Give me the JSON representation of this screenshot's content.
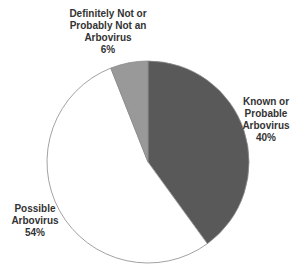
{
  "chart_data": {
    "type": "pie",
    "title": "",
    "start_angle_deg": 0,
    "direction": "clockwise",
    "slices": [
      {
        "name": "Known or Probable Arbovirus",
        "label_lines": [
          "Known or",
          "Probable",
          "Arbovirus",
          "40%"
        ],
        "value": 40,
        "color": "#595959"
      },
      {
        "name": "Possible Arbovirus",
        "label_lines": [
          "Possible",
          "Arbovirus",
          "54%"
        ],
        "value": 54,
        "color": "#ffffff"
      },
      {
        "name": "Definitely Not or Probably Not an Arbovirus",
        "label_lines": [
          "Definitely Not or",
          "Probably Not an",
          "Arbovirus",
          "6%"
        ],
        "value": 6,
        "color": "#999999"
      }
    ],
    "categories": [
      "Known or Probable Arbovirus",
      "Possible Arbovirus",
      "Definitely Not or Probably Not an Arbovirus"
    ],
    "values": [
      40,
      54,
      6
    ],
    "units": "%",
    "legend": "none (data labels beside slices)",
    "outline_color": "#8a8a8a"
  },
  "layout": {
    "cx": 148,
    "cy": 162,
    "r": 101,
    "label_positions": [
      {
        "x": 266,
        "y": 96
      },
      {
        "x": 35,
        "y": 203
      },
      {
        "x": 108,
        "y": 8
      }
    ]
  }
}
